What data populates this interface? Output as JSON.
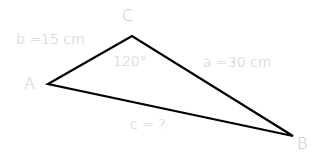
{
  "diagram": {
    "type": "triangle",
    "vertices": {
      "A": {
        "label": "A",
        "x": 48,
        "y": 84
      },
      "B": {
        "label": "B",
        "x": 293,
        "y": 136
      },
      "C": {
        "label": "C",
        "x": 132,
        "y": 36
      }
    },
    "sides": {
      "a": {
        "label": "a =30 cm"
      },
      "b": {
        "label": "b =15 cm"
      },
      "c": {
        "label": "c = ?"
      }
    },
    "angle_C": {
      "label": "120°"
    },
    "colors": {
      "line": "#000000",
      "text": "#c8c8c8"
    }
  }
}
